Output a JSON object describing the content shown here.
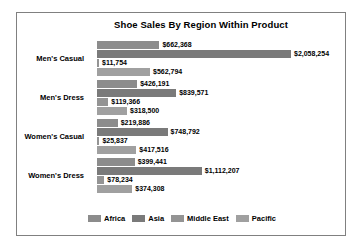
{
  "chart_data": {
    "type": "bar",
    "orientation": "horizontal",
    "grouped": true,
    "title": "Shoe Sales By Region Within Product",
    "xlabel": "",
    "ylabel": "",
    "grid": false,
    "legend_position": "bottom",
    "categories": [
      "Men's Casual",
      "Men's Dress",
      "Women's Casual",
      "Women's Dress"
    ],
    "series": [
      {
        "name": "Africa",
        "color": "#8c8c8c",
        "values": [
          662368,
          426191,
          219886,
          399441
        ],
        "labels": [
          "$662,368",
          "$426,191",
          "$219,886",
          "$399,441"
        ]
      },
      {
        "name": "Asia",
        "color": "#7a7a7a",
        "values": [
          2058254,
          839571,
          748792,
          1112207
        ],
        "labels": [
          "$2,058,254",
          "$839,571",
          "$748,792",
          "$1,112,207"
        ]
      },
      {
        "name": "Middle East",
        "color": "#949494",
        "values": [
          11754,
          119366,
          25837,
          78234
        ],
        "labels": [
          "$11,754",
          "$119,366",
          "$25,837",
          "$78,234"
        ]
      },
      {
        "name": "Pacific",
        "color": "#a0a0a0",
        "values": [
          562794,
          318500,
          417516,
          374308
        ],
        "labels": [
          "$562,794",
          "$318,500",
          "$417,516",
          "$374,308"
        ]
      }
    ],
    "xmax": 2058254,
    "axis_max_px": 194
  },
  "legend": {
    "items": [
      {
        "label": "Africa",
        "color": "#8c8c8c"
      },
      {
        "label": "Asia",
        "color": "#7a7a7a"
      },
      {
        "label": "Middle East",
        "color": "#949494"
      },
      {
        "label": "Pacific",
        "color": "#a0a0a0"
      }
    ]
  }
}
